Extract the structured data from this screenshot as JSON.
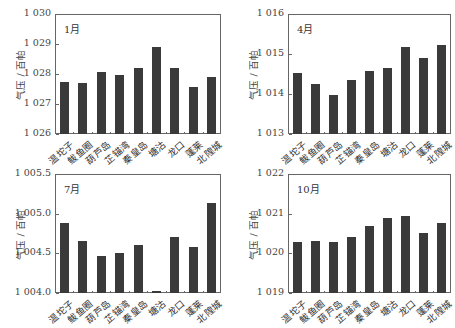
{
  "chart_data": [
    {
      "type": "bar",
      "title": "1月",
      "xlabel": "",
      "ylabel": "气压 / 百帕",
      "categories": [
        "温坨子",
        "鲅鱼圈",
        "葫芦岛",
        "芷锚湾",
        "秦皇岛",
        "塘沽",
        "龙口",
        "蓬莱",
        "北隍城"
      ],
      "values": [
        1027.73,
        1027.7,
        1028.08,
        1027.97,
        1028.21,
        1028.91,
        1028.21,
        1027.56,
        1027.9
      ],
      "ylim": [
        1026,
        1030
      ],
      "yticks": [
        "1 026",
        "1 027",
        "1 028",
        "1 029",
        "1 030"
      ],
      "grid": false
    },
    {
      "type": "bar",
      "title": "4月",
      "xlabel": "",
      "ylabel": "气压 / 百帕",
      "categories": [
        "温坨子",
        "鲅鱼圈",
        "葫芦岛",
        "芷锚湾",
        "秦皇岛",
        "塘沽",
        "龙口",
        "蓬莱",
        "北隍城"
      ],
      "values": [
        1014.52,
        1014.24,
        1013.97,
        1014.34,
        1014.57,
        1014.64,
        1015.17,
        1014.9,
        1015.23
      ],
      "ylim": [
        1013,
        1016
      ],
      "yticks": [
        "1 013",
        "1 014",
        "1 015",
        "1 016"
      ],
      "grid": false
    },
    {
      "type": "bar",
      "title": "7月",
      "xlabel": "",
      "ylabel": "气压 / 百帕",
      "categories": [
        "温坨子",
        "鲅鱼圈",
        "葫芦岛",
        "芷锚湾",
        "秦皇岛",
        "塘沽",
        "龙口",
        "蓬莱",
        "北隍城"
      ],
      "values": [
        1004.88,
        1004.65,
        1004.47,
        1004.51,
        1004.6,
        1004.03,
        1004.7,
        1004.58,
        1005.14
      ],
      "ylim": [
        1004.0,
        1005.5
      ],
      "yticks": [
        "1 004.0",
        "1 004.5",
        "1 005.0",
        "1 005.5"
      ],
      "grid": false
    },
    {
      "type": "bar",
      "title": "10月",
      "xlabel": "",
      "ylabel": "气压 / 百帕",
      "categories": [
        "温坨子",
        "鲅鱼圈",
        "葫芦岛",
        "芷锚湾",
        "秦皇岛",
        "塘沽",
        "龙口",
        "蓬莱",
        "北隍城"
      ],
      "values": [
        1020.29,
        1020.3,
        1020.29,
        1020.4,
        1020.69,
        1020.9,
        1020.93,
        1020.51,
        1020.76
      ],
      "ylim": [
        1019,
        1022
      ],
      "yticks": [
        "1 019",
        "1 020",
        "1 021",
        "1 022"
      ],
      "grid": false
    }
  ],
  "colors": {
    "bar": "#3a3a3a",
    "frame": "#666666"
  }
}
